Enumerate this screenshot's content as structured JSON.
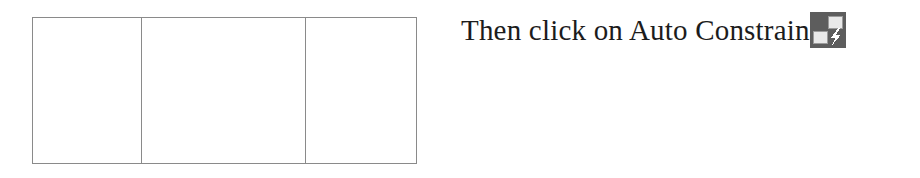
{
  "page": {
    "background_color": "#ffffff",
    "text_color": "#1c1c1c"
  },
  "figure": {
    "name": "empty-three-column-table",
    "border_color": "#8a8a8a",
    "fill_color": "#ffffff",
    "column_count": 3,
    "row_count": 1,
    "columns": [
      {
        "label": "",
        "value": ""
      },
      {
        "label": "",
        "value": ""
      },
      {
        "label": "",
        "value": ""
      }
    ]
  },
  "instruction": {
    "text": "Then click on Auto Constrain",
    "icon": {
      "name": "auto-constrain-icon",
      "background_color": "#5d5d5d",
      "tile_color": "#e8e8e8",
      "bolt_color": "#ffffff",
      "tile_border_color": "#9a9a9a"
    }
  }
}
